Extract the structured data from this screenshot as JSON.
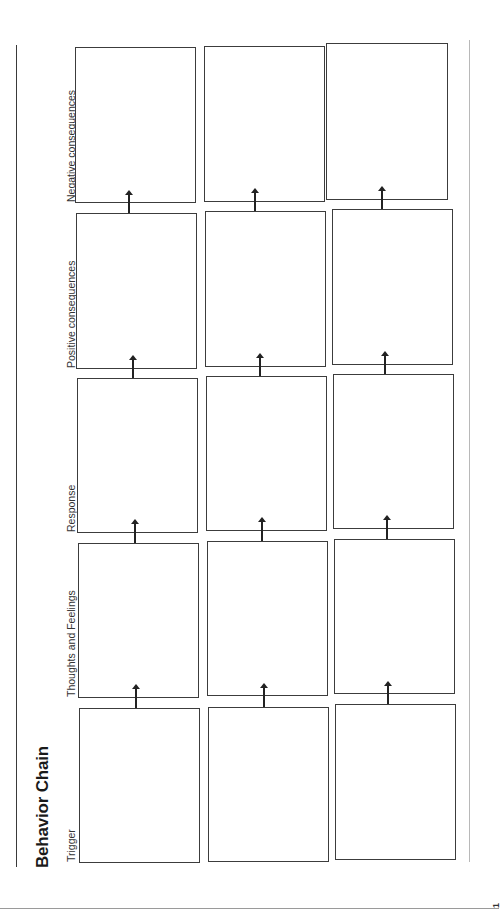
{
  "worksheet": {
    "title": "Behavior Chain",
    "orientation": "rotated-90-ccw",
    "columns": [
      {
        "label": "Trigger"
      },
      {
        "label": "Thoughts and Feelings"
      },
      {
        "label": "Response"
      },
      {
        "label": "Positive consequences"
      },
      {
        "label": "Negative consequences"
      }
    ],
    "rows_count": 3,
    "cells": [
      [
        "",
        "",
        "",
        "",
        ""
      ],
      [
        "",
        "",
        "",
        "",
        ""
      ],
      [
        "",
        "",
        "",
        "",
        ""
      ]
    ],
    "page_number": "1"
  }
}
